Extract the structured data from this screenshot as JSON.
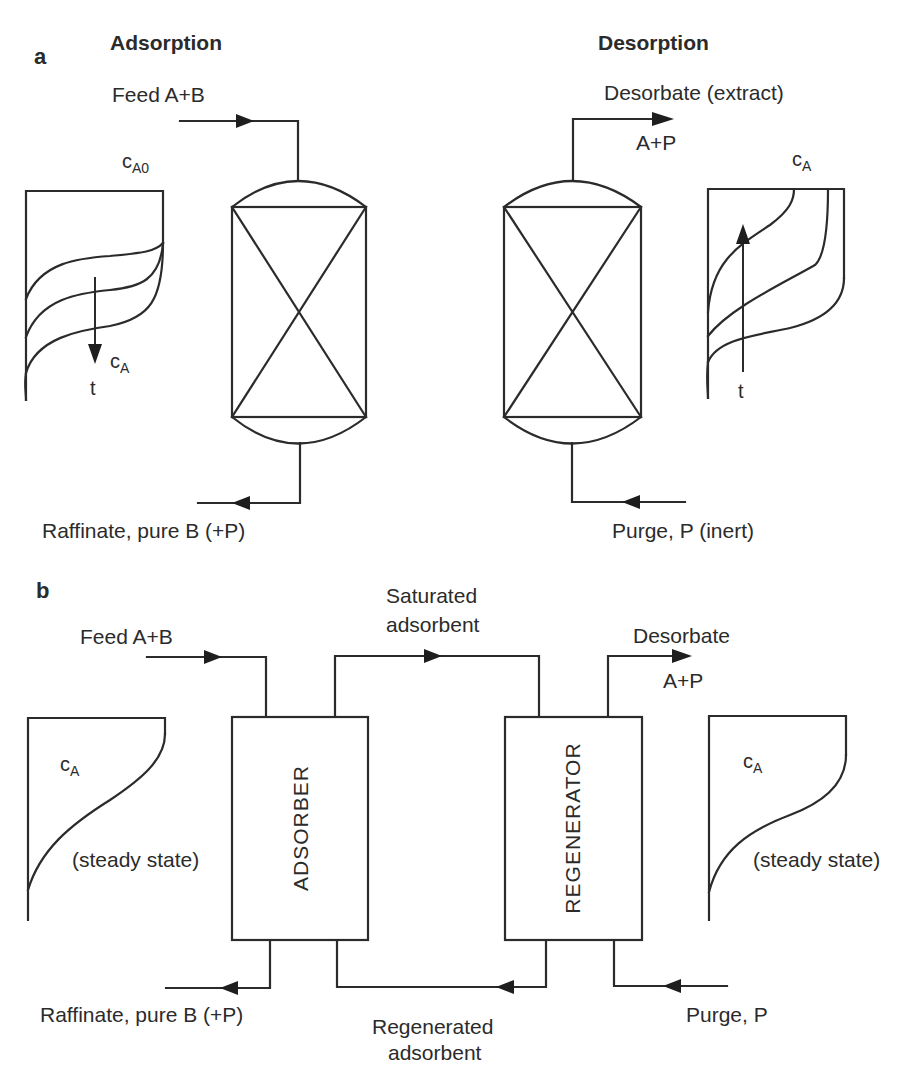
{
  "panel_a": {
    "letter": "a",
    "adsorption": {
      "heading": "Adsorption",
      "feed_label": "Feed A+B",
      "profile_top_label": {
        "main": "c",
        "sub": "A0"
      },
      "profile_axis_label": {
        "main": "c",
        "sub": "A"
      },
      "time_label": "t",
      "outlet_label": "Raffinate, pure B (+P)"
    },
    "desorption": {
      "heading": "Desorption",
      "outlet_label": "Desorbate (extract)",
      "outlet_species": "A+P",
      "profile_top_label": {
        "main": "c",
        "sub": "A"
      },
      "time_label": "t",
      "inlet_label": "Purge, P (inert)"
    }
  },
  "panel_b": {
    "letter": "b",
    "feed_label": "Feed A+B",
    "saturated_label_line1": "Saturated",
    "saturated_label_line2": "adsorbent",
    "desorbate_label": "Desorbate",
    "desorbate_species": "A+P",
    "adsorber_label": "ADSORBER",
    "regenerator_label": "REGENERATOR",
    "left_profile": {
      "conc": {
        "main": "c",
        "sub": "A"
      },
      "note": "(steady state)"
    },
    "right_profile": {
      "conc": {
        "main": "c",
        "sub": "A"
      },
      "note": "(steady state)"
    },
    "raffinate_label": "Raffinate, pure B (+P)",
    "regenerated_label_line1": "Regenerated",
    "regenerated_label_line2": "adsorbent",
    "purge_label": "Purge, P"
  },
  "colors": {
    "line": "#2b2b2b",
    "background": "#ffffff"
  }
}
